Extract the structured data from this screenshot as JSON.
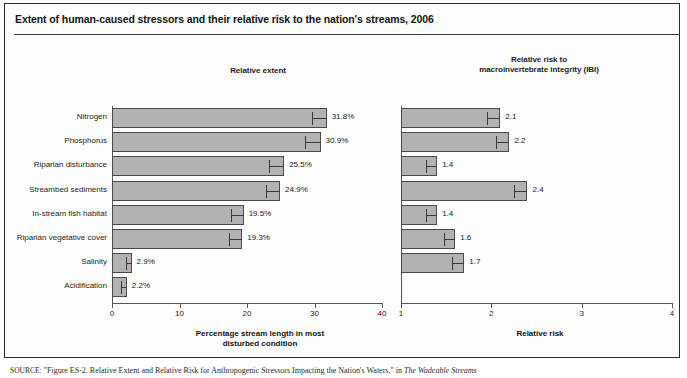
{
  "figure": {
    "title": "Extent of human-caused stressors and their relative risk to the nation's streams, 2006",
    "source_prefix": "SOURCE:",
    "source_quote": "\"Figure ES-2. Relative Extent and Relative Risk for Anthropogenic Stressors Impacting the Nation's Waters,\"",
    "source_in": "in",
    "source_pub": "The Wadeable Streams"
  },
  "panels": {
    "left": {
      "heading": "Relative extent",
      "xlabel_line1": "Percentage stream length in most",
      "xlabel_line2": "disturbed condition"
    },
    "right": {
      "heading_line1": "Relative risk to",
      "heading_line2": "macroinvertebrate integrity (IBI)",
      "xlabel": "Relative risk"
    }
  },
  "chart_data": [
    {
      "type": "bar",
      "orientation": "horizontal",
      "title": "Relative extent",
      "xlabel": "Percentage stream length in most disturbed condition",
      "ylabel": "",
      "xlim": [
        0,
        40
      ],
      "xticks": [
        0,
        10,
        20,
        30,
        40
      ],
      "xticklabels": [
        "0",
        "10",
        "20",
        "30",
        "40"
      ],
      "grid": false,
      "categories": [
        "Nitrogen",
        "Phosphorus",
        "Riparian disturbance",
        "Streambed sediments",
        "In-stream fish habitat",
        "Riparian vegetative cover",
        "Salinity",
        "Acidification"
      ],
      "values": [
        31.8,
        30.9,
        25.5,
        24.9,
        19.5,
        19.3,
        2.9,
        2.2
      ],
      "value_labels": [
        "31.8%",
        "30.9%",
        "25.5%",
        "24.9%",
        "19.5%",
        "19.3%",
        "2.9%",
        "2.2%"
      ],
      "error_low": [
        29.7,
        28.6,
        23.3,
        22.8,
        17.6,
        17.4,
        2.0,
        1.3
      ]
    },
    {
      "type": "bar",
      "orientation": "horizontal",
      "title": "Relative risk to macroinvertebrate integrity (IBI)",
      "xlabel": "Relative risk",
      "ylabel": "",
      "xlim": [
        1,
        4
      ],
      "xticks": [
        1,
        2,
        3,
        4
      ],
      "xticklabels": [
        "1",
        "2",
        "3",
        "4"
      ],
      "grid": false,
      "categories": [
        "Nitrogen",
        "Phosphorus",
        "Riparian disturbance",
        "Streambed sediments",
        "In-stream fish habitat",
        "Riparian vegetative cover",
        "Salinity",
        "Acidification"
      ],
      "values": [
        2.1,
        2.2,
        1.4,
        2.4,
        1.4,
        1.6,
        1.7,
        null
      ],
      "value_labels": [
        "2.1",
        "2.2",
        "1.4",
        "2.4",
        "1.4",
        "1.6",
        "1.7",
        ""
      ],
      "error_low": [
        1.95,
        2.05,
        1.28,
        2.25,
        1.28,
        1.48,
        1.57,
        null
      ]
    }
  ]
}
